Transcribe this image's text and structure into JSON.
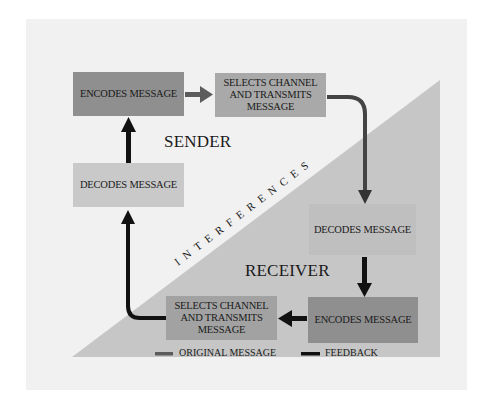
{
  "diagram": {
    "type": "communication-process",
    "regions": {
      "sender": "SENDER",
      "receiver": "RECEIVER",
      "barrier": "INTERFERENCES"
    },
    "sender": {
      "encodes": "ENCODES MESSAGE",
      "selects_line1": "SELECTS CHANNEL",
      "selects_line2": "AND TRANSMITS",
      "selects_line3": "MESSAGE",
      "decodes": "DECODES MESSAGE"
    },
    "receiver": {
      "decodes": "DECODES MESSAGE",
      "encodes": "ENCODES MESSAGE",
      "selects_line1": "SELECTS CHANNEL",
      "selects_line2": "AND TRANSMITS",
      "selects_line3": "MESSAGE"
    },
    "legend": [
      {
        "label": "ORIGINAL MESSAGE",
        "color": "#5c5c5c"
      },
      {
        "label": "FEEDBACK",
        "color": "#111111"
      }
    ],
    "colors": {
      "background_panel": "#f1f1f1",
      "triangle": "#c6c6c6",
      "original_arrow": "#555555",
      "feedback_arrow": "#111111"
    }
  }
}
